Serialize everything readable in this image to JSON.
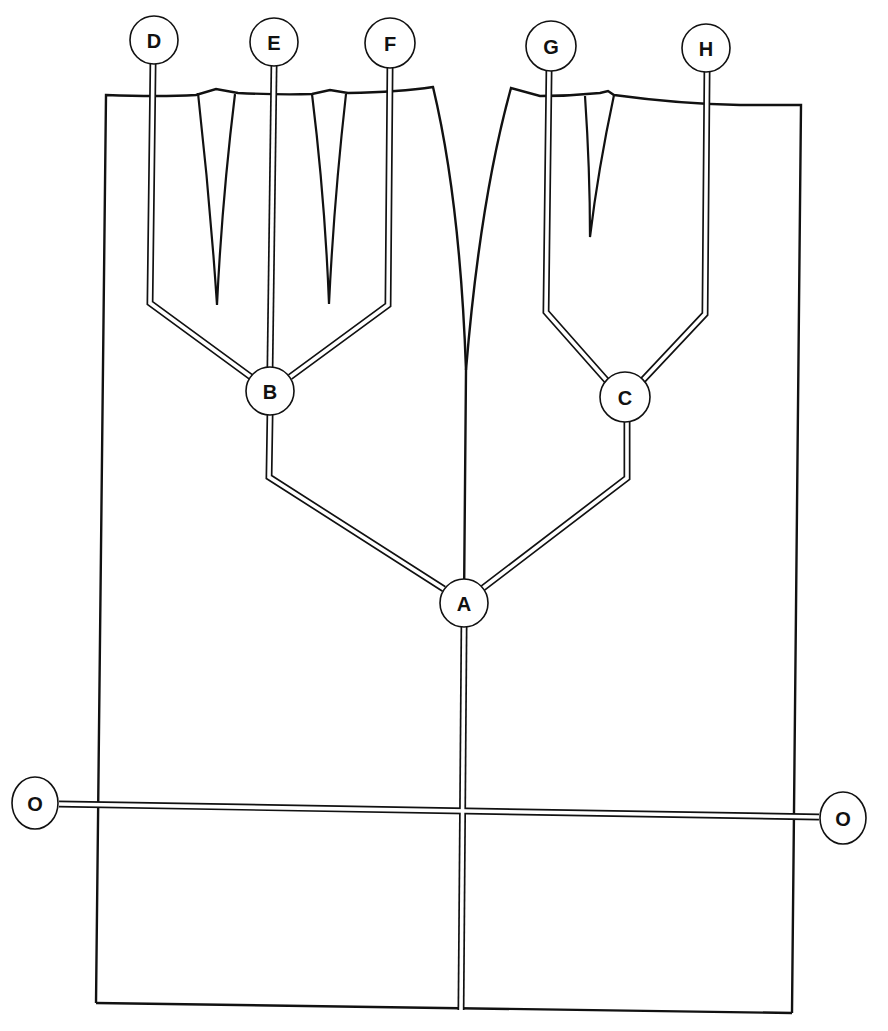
{
  "diagram": {
    "title": "",
    "colors": {
      "line": "#111111",
      "background": "#ffffff"
    },
    "nodes": [
      {
        "id": "A",
        "label": "A",
        "cx": 464,
        "cy": 603,
        "r": 24
      },
      {
        "id": "B",
        "label": "B",
        "cx": 270,
        "cy": 391,
        "r": 24
      },
      {
        "id": "C",
        "label": "C",
        "cx": 625,
        "cy": 397,
        "r": 25
      },
      {
        "id": "D",
        "label": "D",
        "cx": 154,
        "cy": 40,
        "r": 24
      },
      {
        "id": "E",
        "label": "E",
        "cx": 274,
        "cy": 42,
        "r": 24
      },
      {
        "id": "F",
        "label": "F",
        "cx": 390,
        "cy": 43,
        "r": 25
      },
      {
        "id": "G",
        "label": "G",
        "cx": 551,
        "cy": 46,
        "r": 25
      },
      {
        "id": "H",
        "label": "H",
        "cx": 706,
        "cy": 48,
        "r": 24
      },
      {
        "id": "O-left",
        "label": "O",
        "cx": 35,
        "cy": 803,
        "r": 24
      },
      {
        "id": "O-right",
        "label": "O",
        "cx": 843,
        "cy": 818,
        "r": 24
      }
    ],
    "edges": [
      {
        "from": "A",
        "to": "B"
      },
      {
        "from": "A",
        "to": "C"
      },
      {
        "from": "B",
        "to": "D"
      },
      {
        "from": "B",
        "to": "E"
      },
      {
        "from": "B",
        "to": "F"
      },
      {
        "from": "C",
        "to": "G"
      },
      {
        "from": "C",
        "to": "H"
      },
      {
        "from": "O-left",
        "to": "O-right"
      }
    ]
  }
}
